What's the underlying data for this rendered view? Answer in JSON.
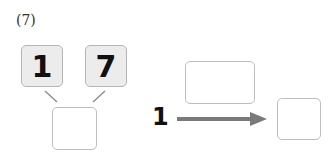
{
  "problem": {
    "label": "(7)",
    "tens_digit": "1",
    "ones_digit": "7",
    "given_number": "1",
    "colors": {
      "digit_box_fill": "#ececec",
      "box_border": "#bdbdbd",
      "arrow": "#7a7a7a",
      "connector": "#8a8a8a"
    }
  }
}
